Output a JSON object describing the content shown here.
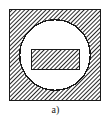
{
  "figure": {
    "label": "a)",
    "background_color": "#ffffff",
    "line_color": "#1a1a1a",
    "hatch_color": "#2b2b2b",
    "fill_color": "#ffffff",
    "canvas": {
      "width": 111,
      "height": 124
    },
    "shapes": {
      "outer_square": {
        "name": "hatched-square-block",
        "x": 9,
        "y": 9,
        "width": 92,
        "height": 92,
        "stroke_width": 1.4,
        "fill": "hatch-45",
        "hatch_angle_deg": 45,
        "hatch_spacing_px": 3
      },
      "bore_circle": {
        "name": "circular-bore",
        "cx": 55,
        "cy": 55,
        "r": 36,
        "stroke_width": 1.4,
        "fill": "#ffffff"
      },
      "inner_rectangle": {
        "name": "hatched-rectangular-insert",
        "x": 31,
        "y": 49,
        "width": 49,
        "height": 21,
        "stroke_width": 1.2,
        "fill": "hatch-45",
        "hatch_angle_deg": 45,
        "hatch_spacing_px": 3
      }
    }
  }
}
